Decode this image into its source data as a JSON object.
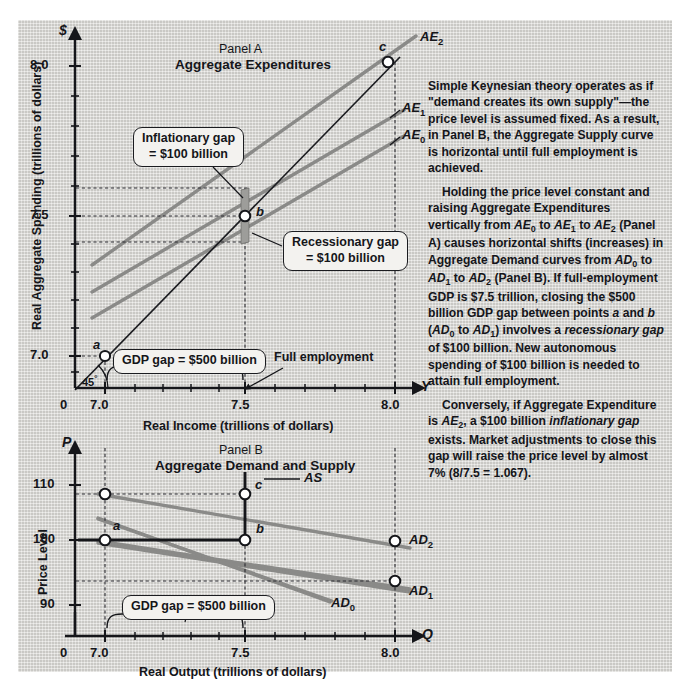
{
  "figure": {
    "background_hex": "#d8d7d3",
    "ink_hex": "#15161a",
    "curve_gray_hex": "#8a8a88"
  },
  "panel_a": {
    "kicker": "Panel A",
    "title": "Aggregate Expenditures",
    "y_axis_symbol": "$",
    "y_axis_title": "Real Aggregate Spending (trillions of dollars)",
    "y_ticks": [
      "8.0",
      "7.5",
      "7.0"
    ],
    "x_axis_symbol": "Y",
    "x_axis_title": "Real Income (trillions of dollars)",
    "x_ticks": [
      "0",
      "7.0",
      "7.5",
      "8.0"
    ],
    "angle_label": "45",
    "angle_degree": "°",
    "curve_labels": [
      {
        "base": "AE",
        "sub": "2"
      },
      {
        "base": "AE",
        "sub": "1"
      },
      {
        "base": "AE",
        "sub": "0"
      }
    ],
    "points": [
      "a",
      "b",
      "c"
    ],
    "callouts": {
      "inflationary": "Inflationary gap\n= $100 billion",
      "inflationary_line1": "Inflationary gap",
      "inflationary_line2": "= $100 billion",
      "recessionary_line1": "Recessionary gap",
      "recessionary_line2": "= $100 billion",
      "gdp_gap": "GDP gap = $500 billion"
    },
    "full_employment_label": "Full employment"
  },
  "panel_b": {
    "kicker": "Panel B",
    "title": "Aggregate Demand and Supply",
    "y_axis_symbol": "P",
    "y_axis_title": "Price Level",
    "y_ticks": [
      "110",
      "100",
      "90"
    ],
    "x_axis_symbol": "Q",
    "x_axis_title": "Real Output (trillions of dollars)",
    "x_ticks": [
      "0",
      "7.0",
      "7.5",
      "8.0"
    ],
    "curve_labels": [
      {
        "base": "AS",
        "sub": ""
      },
      {
        "base": "AD",
        "sub": "2"
      },
      {
        "base": "AD",
        "sub": "1"
      },
      {
        "base": "AD",
        "sub": "0"
      }
    ],
    "points": [
      "a",
      "b",
      "c"
    ],
    "callouts": {
      "gdp_gap": "GDP gap = $500 billion"
    }
  },
  "notes": {
    "p1": "Simple Keynesian theory operates as if \"demand creates its own supply\"—the price level is assumed fixed. As a result, in Panel B, the Aggregate Supply curve is horizontal until full employment is achieved.",
    "p2": "Holding the price level constant and raising Aggregate Expenditures vertically from AE0 to AE1 to AE2 (Panel A) causes horizontal shifts (increases) in Aggregate Demand curves from AD0 to AD1 to AD2 (Panel B). If full-employment GDP is $7.5 trillion, closing the $500 billion GDP gap between points a and b (AD0 to AD1) involves a recessionary gap of $100 billion. New autonomous spending of $100 billion is needed to attain full employment.",
    "p3": "Conversely, if Aggregate Expenditure is AE2, a $100 billion inflationary gap exists. Market adjustments to close this gap will raise the price level by almost 7% (8/7.5 = 1.067)."
  },
  "chart_data": [
    {
      "type": "line",
      "panel": "A",
      "title": "Panel A — Aggregate Expenditures",
      "xlabel": "Real Income (trillions of dollars)",
      "ylabel": "Real Aggregate Spending (trillions of dollars)",
      "xlim": [
        6.8,
        8.1
      ],
      "ylim": [
        6.85,
        8.15
      ],
      "xticks": [
        0,
        7.0,
        7.5,
        8.0
      ],
      "yticks": [
        7.0,
        7.5,
        8.0
      ],
      "grid": false,
      "legend": "inline-curve-labels",
      "series": [
        {
          "name": "45-degree line",
          "x": [
            6.85,
            8.05
          ],
          "y": [
            6.85,
            8.05
          ],
          "style": "solid-thin-black"
        },
        {
          "name": "AE0",
          "x": [
            6.88,
            8.05
          ],
          "y": [
            6.98,
            7.72
          ],
          "style": "solid-gray"
        },
        {
          "name": "AE1",
          "x": [
            6.88,
            8.05
          ],
          "y": [
            7.07,
            7.81
          ],
          "style": "solid-gray"
        },
        {
          "name": "AE2",
          "x": [
            6.88,
            8.07
          ],
          "y": [
            7.17,
            7.92
          ],
          "style": "solid-gray"
        }
      ],
      "annotated_points": [
        {
          "label": "a",
          "x": 7.0,
          "y": 7.0
        },
        {
          "label": "b",
          "x": 7.5,
          "y": 7.5
        },
        {
          "label": "c",
          "x": 8.0,
          "y": 8.0
        }
      ],
      "annotations": [
        {
          "text": "Inflationary gap = $100 billion",
          "at_x": 7.5,
          "value": 0.1
        },
        {
          "text": "Recessionary gap = $100 billion",
          "at_x": 7.5,
          "value": 0.1
        },
        {
          "text": "GDP gap = $500 billion",
          "from_x": 7.0,
          "to_x": 7.5,
          "value": 0.5
        },
        {
          "text": "Full employment",
          "at_x": 7.5
        }
      ]
    },
    {
      "type": "line",
      "panel": "B",
      "title": "Panel B — Aggregate Demand and Supply",
      "xlabel": "Real Output (trillions of dollars)",
      "ylabel": "Price Level",
      "xlim": [
        6.8,
        8.1
      ],
      "ylim": [
        86,
        115
      ],
      "xticks": [
        0,
        7.0,
        7.5,
        8.0
      ],
      "yticks": [
        90,
        100,
        110
      ],
      "grid": false,
      "legend": "inline-curve-labels",
      "series": [
        {
          "name": "AS",
          "x": [
            6.82,
            7.5,
            7.5
          ],
          "y": [
            100,
            100,
            114
          ],
          "style": "solid-black-kinked"
        },
        {
          "name": "AD0",
          "x": [
            6.92,
            7.85
          ],
          "y": [
            104.5,
            91.5
          ],
          "style": "solid-gray"
        },
        {
          "name": "AD1",
          "x": [
            6.92,
            8.05
          ],
          "y": [
            108.5,
            93.5
          ],
          "style": "solid-gray"
        },
        {
          "name": "AD2",
          "x": [
            7.12,
            8.05
          ],
          "y": [
            112.5,
            100.5
          ],
          "style": "solid-gray"
        }
      ],
      "annotated_points": [
        {
          "label": "a",
          "x": 7.0,
          "y": 100
        },
        {
          "label": "b",
          "x": 7.5,
          "y": 100
        },
        {
          "label": "c",
          "x": 7.5,
          "y": 108
        },
        {
          "label": "AD2 at 8.0",
          "x": 8.0,
          "y": 100.5
        },
        {
          "label": "AD1 at 8.0",
          "x": 8.0,
          "y": 93.5
        },
        {
          "label": "AD2 at 7.0",
          "x": 7.0,
          "y": 108
        }
      ],
      "annotations": [
        {
          "text": "GDP gap = $500 billion",
          "from_x": 7.0,
          "to_x": 7.5,
          "value": 0.5
        }
      ]
    }
  ]
}
